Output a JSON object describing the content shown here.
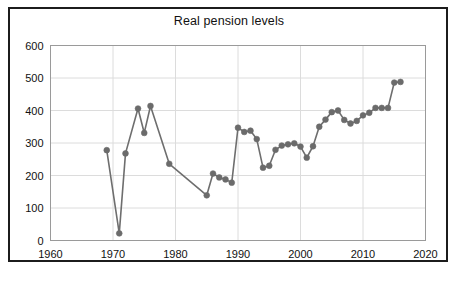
{
  "chart": {
    "title": "Real pension levels",
    "frame_color": "#1c1c1c",
    "series_color": "#6e6e6e",
    "marker_color": "#6b6b6b",
    "grid_color": "#dcdcdc",
    "background": "#ffffff"
  },
  "axes": {
    "y_ticks": [
      "0",
      "100",
      "200",
      "300",
      "400",
      "500",
      "600"
    ],
    "x_ticks": [
      "1960",
      "1970",
      "1980",
      "1990",
      "2000",
      "2010",
      "2020"
    ]
  },
  "chart_data": {
    "type": "line",
    "title": "Real pension levels",
    "xlabel": "",
    "ylabel": "",
    "xlim": [
      1960,
      2020
    ],
    "ylim": [
      0,
      600
    ],
    "grid": true,
    "legend": "none",
    "marker": "circle",
    "x": [
      1969,
      1971,
      1972,
      1974,
      1975,
      1976,
      1979,
      1985,
      1986,
      1987,
      1988,
      1989,
      1990,
      1991,
      1992,
      1993,
      1994,
      1995,
      1996,
      1997,
      1998,
      1999,
      2000,
      2001,
      2002,
      2003,
      2004,
      2005,
      2006,
      2007,
      2008,
      2009,
      2010,
      2011,
      2012,
      2013,
      2014,
      2015,
      2016
    ],
    "y": [
      278,
      22,
      268,
      406,
      331,
      414,
      236,
      139,
      206,
      194,
      188,
      178,
      347,
      334,
      338,
      312,
      224,
      230,
      279,
      292,
      296,
      299,
      289,
      255,
      290,
      350,
      372,
      395,
      400,
      371,
      360,
      368,
      385,
      393,
      408,
      408,
      408,
      486,
      488
    ],
    "series": [
      {
        "name": "Real pension levels",
        "values": [
          278,
          22,
          268,
          406,
          331,
          414,
          236,
          139,
          206,
          194,
          188,
          178,
          347,
          334,
          338,
          312,
          224,
          230,
          279,
          292,
          296,
          299,
          289,
          255,
          290,
          350,
          372,
          395,
          400,
          371,
          360,
          368,
          385,
          393,
          408,
          408,
          408,
          486,
          488
        ]
      }
    ]
  }
}
